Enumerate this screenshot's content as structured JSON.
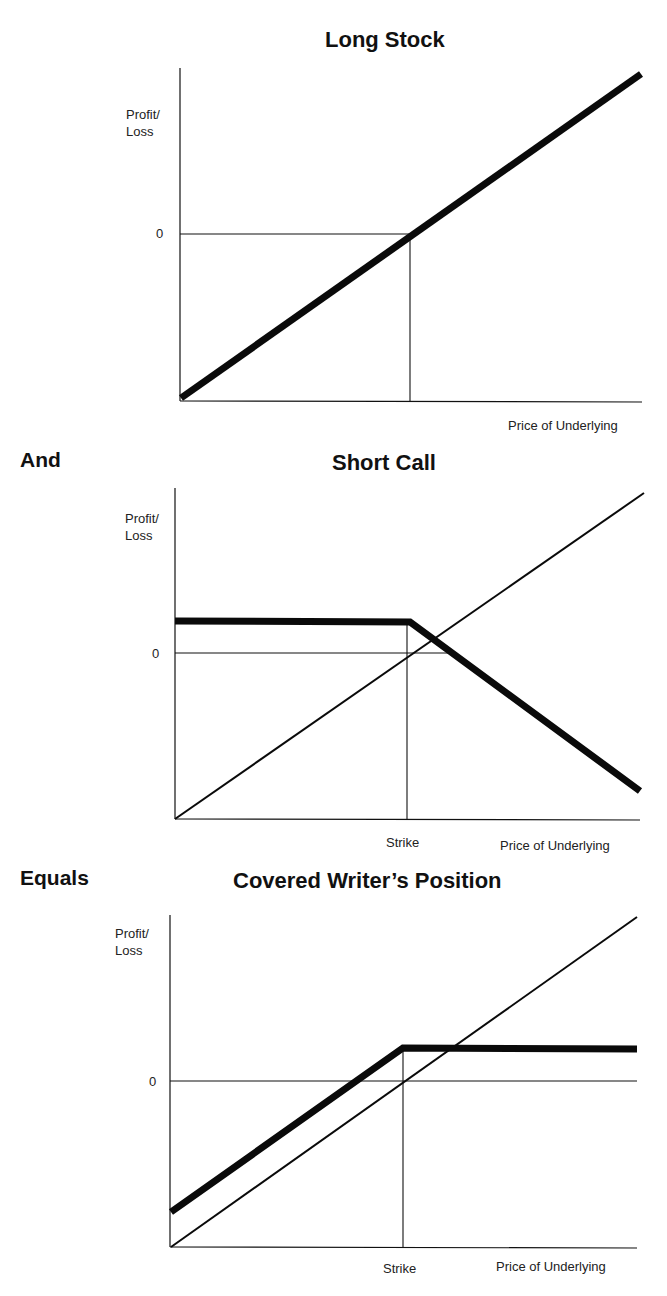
{
  "connectors": {
    "and": "And",
    "equals": "Equals"
  },
  "charts": [
    {
      "title": "Long Stock",
      "ylabel_line1": "Profit/",
      "ylabel_line2": "Loss",
      "zero_tick": "0",
      "xlabel": "Price of Underlying",
      "strike_label": ""
    },
    {
      "title": "Short Call",
      "ylabel_line1": "Profit/",
      "ylabel_line2": "Loss",
      "zero_tick": "0",
      "xlabel": "Price of Underlying",
      "strike_label": "Strike"
    },
    {
      "title": "Covered Writer’s Position",
      "ylabel_line1": "Profit/",
      "ylabel_line2": "Loss",
      "zero_tick": "0",
      "xlabel": "Price of Underlying",
      "strike_label": "Strike"
    }
  ],
  "chart_data": [
    {
      "type": "line",
      "title": "Long Stock",
      "xlabel": "Price of Underlying",
      "ylabel": "Profit/Loss",
      "y_ticks": [
        "0"
      ],
      "x_range": [
        0,
        1
      ],
      "y_range": [
        -1,
        1
      ],
      "strike_x": 0.5,
      "series": [
        {
          "name": "Long stock P/L",
          "style": "thick",
          "points": [
            [
              0,
              -1
            ],
            [
              1,
              1
            ]
          ]
        }
      ],
      "grid": false,
      "pixels": {
        "origin": [
          180,
          401
        ],
        "x_end": 642,
        "y_top": 68,
        "zero_y": 234,
        "strike_x": 410,
        "thick": [
          [
            181,
            398
          ],
          [
            641,
            74
          ]
        ],
        "thin": [],
        "zero_line_end": 410,
        "strike_top": 234
      }
    },
    {
      "type": "line",
      "title": "Short Call",
      "xlabel": "Price of Underlying",
      "ylabel": "Profit/Loss",
      "y_ticks": [
        "0"
      ],
      "x_annotations": [
        "Strike"
      ],
      "strike_x": 0.5,
      "series": [
        {
          "name": "Short call P/L",
          "style": "thick",
          "points": [
            [
              0,
              0.2
            ],
            [
              0.5,
              0.2
            ],
            [
              1,
              -0.85
            ]
          ]
        },
        {
          "name": "Long stock reference",
          "style": "thin",
          "points": [
            [
              0,
              -1
            ],
            [
              1,
              1
            ]
          ]
        }
      ],
      "grid": false,
      "pixels": {
        "origin": [
          175,
          819
        ],
        "x_end": 640,
        "y_top": 488,
        "zero_y": 653,
        "strike_x": 407,
        "thick": [
          [
            175,
            621
          ],
          [
            410,
            622
          ],
          [
            640,
            791
          ]
        ],
        "thin": [
          [
            175,
            819
          ],
          [
            644,
            493
          ]
        ],
        "zero_line_end": 450,
        "strike_top": 621
      }
    },
    {
      "type": "line",
      "title": "Covered Writer’s Position",
      "xlabel": "Price of Underlying",
      "ylabel": "Profit/Loss",
      "y_ticks": [
        "0"
      ],
      "x_annotations": [
        "Strike"
      ],
      "strike_x": 0.5,
      "series": [
        {
          "name": "Covered write P/L",
          "style": "thick",
          "points": [
            [
              0,
              -0.8
            ],
            [
              0.5,
              0.2
            ],
            [
              1,
              0.2
            ]
          ]
        },
        {
          "name": "Long stock reference",
          "style": "thin",
          "points": [
            [
              0,
              -1
            ],
            [
              1,
              1
            ]
          ]
        }
      ],
      "grid": false,
      "pixels": {
        "origin": [
          170,
          1247
        ],
        "x_end": 637,
        "y_top": 915,
        "zero_y": 1081,
        "strike_x": 403,
        "thick": [
          [
            171,
            1212
          ],
          [
            403,
            1048
          ],
          [
            637,
            1049
          ]
        ],
        "thin": [
          [
            171,
            1247
          ],
          [
            637,
            917
          ]
        ],
        "zero_line_end": 637,
        "strike_top": 1048
      }
    }
  ]
}
